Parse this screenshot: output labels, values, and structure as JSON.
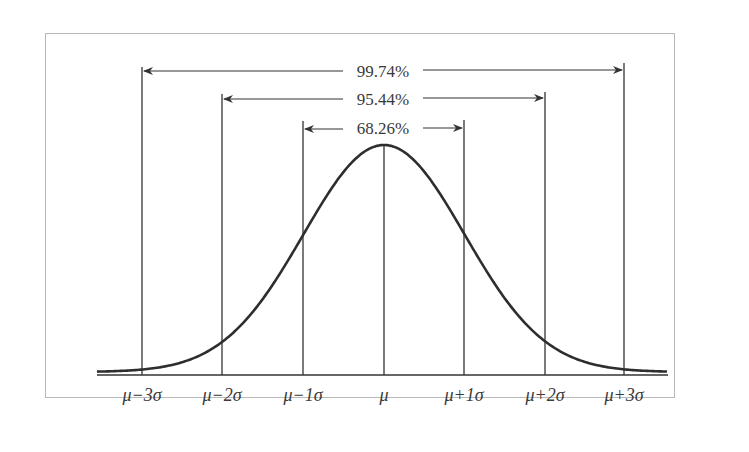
{
  "chart_data": {
    "type": "line",
    "title": "",
    "xlabel": "",
    "ylabel": "",
    "x_ticks": [
      "μ−3σ",
      "μ−2σ",
      "μ−1σ",
      "μ",
      "μ+1σ",
      "μ+2σ",
      "μ+3σ"
    ],
    "x_tick_values": [
      -3,
      -2,
      -1,
      0,
      1,
      2,
      3
    ],
    "curve": {
      "name": "normal density",
      "mean": 0,
      "sd": 1
    },
    "intervals": [
      {
        "label": "68.26%",
        "from": -1,
        "to": 1
      },
      {
        "label": "95.44%",
        "from": -2,
        "to": 2
      },
      {
        "label": "99.74%",
        "from": -3,
        "to": 3
      }
    ],
    "grid": false,
    "legend": null
  },
  "labels": {
    "ticks": [
      "μ−3σ",
      "μ−2σ",
      "μ−1σ",
      "μ",
      "μ+1σ",
      "μ+2σ",
      "μ+3σ"
    ],
    "pct_68": "68.26%",
    "pct_95": "95.44%",
    "pct_99": "99.74%"
  },
  "colors": {
    "line": "#333333",
    "curve": "#2e2e2e",
    "frame": "#b8b8b8",
    "text": "#3a3a3a"
  }
}
